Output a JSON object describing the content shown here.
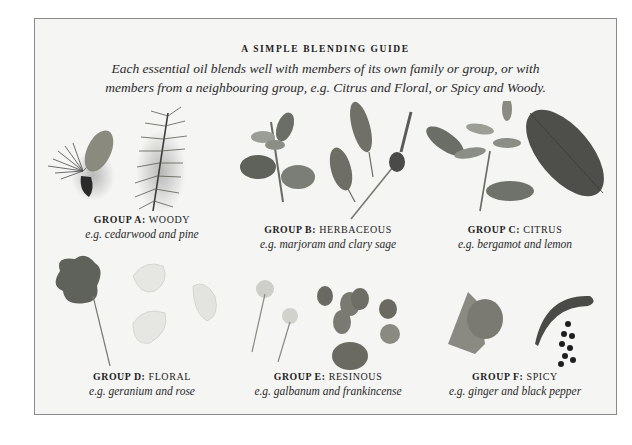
{
  "title": "A SIMPLE BLENDING GUIDE",
  "intro": {
    "line1": "Each essential oil blends well with members of its own family or group, or with",
    "line2": "members from a neighbouring group, e.g. Citrus and Floral, or Spicy and Woody."
  },
  "groups": [
    {
      "prefix": "GROUP A:",
      "name": "WOODY",
      "example": "e.g. cedarwood and pine",
      "image": "cedar-cone-and-pine-sprig"
    },
    {
      "prefix": "GROUP B:",
      "name": "HERBACEOUS",
      "example": "e.g. marjoram and clary sage",
      "image": "marjoram-sprig-and-clary-sage"
    },
    {
      "prefix": "GROUP C:",
      "name": "CITRUS",
      "example": "e.g. bergamot and lemon",
      "image": "bergamot-sprig-and-lemon-leaf"
    },
    {
      "prefix": "GROUP D:",
      "name": "FLORAL",
      "example": "e.g. geranium and rose",
      "image": "geranium-leaf-and-rose-petals"
    },
    {
      "prefix": "GROUP E:",
      "name": "RESINOUS",
      "example": "e.g. galbanum and frankincense",
      "image": "galbanum-flowers-and-frankincense-resin"
    },
    {
      "prefix": "GROUP F:",
      "name": "SPICY",
      "example": "e.g. ginger and black pepper",
      "image": "ginger-root-and-black-peppercorns"
    }
  ]
}
